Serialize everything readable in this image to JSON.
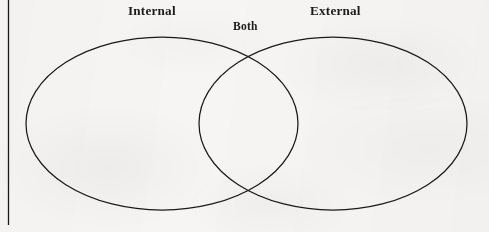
{
  "figure": {
    "kind": "venn-diagram",
    "set_count": 2,
    "background_color": "#f6f5f3",
    "stroke_color": "#1a1a1a",
    "text_color": "#1b1b1b"
  },
  "labels": {
    "left_set": "Internal",
    "right_set": "External",
    "intersection": "Both"
  },
  "geometry": {
    "canvas": {
      "width": 489,
      "height": 232
    },
    "margin_rule": {
      "x": 8.5,
      "y_start": 0,
      "y_end": 225,
      "width": 1.3
    },
    "left_ellipse": {
      "cx": 162,
      "cy": 123.5,
      "rx": 136,
      "ry": 86.5
    },
    "right_ellipse": {
      "cx": 333,
      "cy": 123.5,
      "rx": 134,
      "ry": 86.5
    },
    "intersection_points": [
      {
        "x": 248,
        "y": 51
      },
      {
        "x": 248,
        "y": 196
      }
    ]
  }
}
